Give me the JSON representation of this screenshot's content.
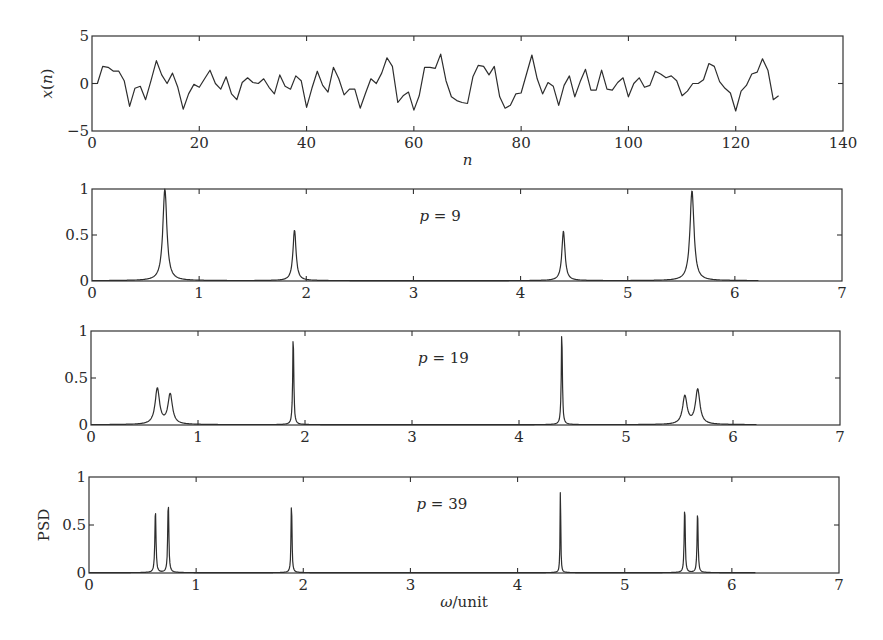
{
  "figure": {
    "colors": {
      "line": "#2e2e2e",
      "frame": "#333333",
      "text": "#2a2a2a",
      "background": "#ffffff"
    }
  },
  "chart_data": [
    {
      "type": "line",
      "panel": "time-series",
      "title": "",
      "xlabel": "n",
      "ylabel": "x(n)",
      "xlim": [
        0,
        140
      ],
      "ylim": [
        -5,
        5
      ],
      "xticks": [
        0,
        20,
        40,
        60,
        80,
        100,
        120,
        140
      ],
      "yticks": [
        -5,
        0,
        5
      ],
      "grid": false,
      "frame_px": {
        "x0": 92,
        "y0": 36,
        "x1": 843,
        "y1": 131
      },
      "x": [
        0,
        1,
        2,
        3,
        4,
        5,
        6,
        7,
        8,
        9,
        10,
        11,
        12,
        13,
        14,
        15,
        16,
        17,
        18,
        19,
        20,
        21,
        22,
        23,
        24,
        25,
        26,
        27,
        28,
        29,
        30,
        31,
        32,
        33,
        34,
        35,
        36,
        37,
        38,
        39,
        40,
        41,
        42,
        43,
        44,
        45,
        46,
        47,
        48,
        49,
        50,
        51,
        52,
        53,
        54,
        55,
        56,
        57,
        58,
        59,
        60,
        61,
        62,
        63,
        64,
        65,
        66,
        67,
        68,
        69,
        70,
        71,
        72,
        73,
        74,
        75,
        76,
        77,
        78,
        79,
        80,
        81,
        82,
        83,
        84,
        85,
        86,
        87,
        88,
        89,
        90,
        91,
        92,
        93,
        94,
        95,
        96,
        97,
        98,
        99,
        100,
        101,
        102,
        103,
        104,
        105,
        106,
        107,
        108,
        109,
        110,
        111,
        112,
        113,
        114,
        115,
        116,
        117,
        118,
        119,
        120,
        121,
        122,
        123,
        124,
        125,
        126,
        127,
        128
      ],
      "values": [
        0,
        0,
        1.8,
        1.7,
        1.3,
        1.3,
        0.3,
        -2.4,
        -0.5,
        -0.3,
        -1.7,
        0.3,
        2.4,
        0.9,
        0,
        1.1,
        -0.4,
        -2.7,
        -1.1,
        -0.1,
        -0.4,
        0.5,
        1.4,
        0,
        -0.6,
        0.7,
        -1.1,
        -1.7,
        0.1,
        0.6,
        0.1,
        0,
        0.5,
        -0.4,
        -1.1,
        0.9,
        -0.3,
        -0.6,
        0.8,
        0.3,
        -2.5,
        -0.5,
        1.3,
        -0.2,
        -0.9,
        1.7,
        0.5,
        -1.2,
        -0.6,
        -0.6,
        -2.6,
        -1,
        0.5,
        0,
        1.1,
        2.7,
        1.8,
        -2,
        -1.3,
        -0.9,
        -2.8,
        -1.3,
        1.7,
        1.7,
        1.6,
        3.1,
        0.3,
        -1.4,
        -1.8,
        -2,
        -2.1,
        0.7,
        1.9,
        1.8,
        0.9,
        1.8,
        -1.4,
        -2.6,
        -2.3,
        -1.1,
        -1,
        1,
        3,
        0.5,
        -1.1,
        0.1,
        -0.3,
        -2.3,
        -0.2,
        0.8,
        -1.4,
        0.2,
        1.5,
        -0.7,
        -0.7,
        1.4,
        -0.6,
        -0.7,
        0.1,
        0.6,
        -1.4,
        0,
        0.6,
        -0.4,
        -0.2,
        1.3,
        1,
        0.6,
        0.8,
        0.3,
        -1.3,
        -0.8,
        0,
        0,
        0.4,
        2.1,
        1.8,
        0.2,
        -0.5,
        -1,
        -2.9,
        -0.8,
        -0.2,
        1,
        1.2,
        2.6,
        1.4,
        -1.7,
        -1.3
      ]
    },
    {
      "type": "line",
      "panel": "psd-p9",
      "annotation": "p = 9",
      "xlabel": "",
      "ylabel": "",
      "xlim": [
        0,
        7
      ],
      "ylim": [
        0,
        1
      ],
      "xticks": [
        0,
        1,
        2,
        3,
        4,
        5,
        6,
        7
      ],
      "yticks": [
        0,
        0.5,
        1
      ],
      "yticklabels": [
        "0",
        "0.5",
        "1"
      ],
      "grid": false,
      "frame_px": {
        "x0": 92,
        "y0": 189,
        "x1": 842,
        "y1": 281
      },
      "omega_max": 6.22,
      "peaks": [
        {
          "omega": 0.68,
          "height": 1.0,
          "width": 0.045
        },
        {
          "omega": 1.89,
          "height": 0.55,
          "width": 0.035
        },
        {
          "omega": 4.4,
          "height": 0.54,
          "width": 0.035
        },
        {
          "omega": 5.6,
          "height": 0.98,
          "width": 0.045
        }
      ]
    },
    {
      "type": "line",
      "panel": "psd-p19",
      "annotation": "p = 19",
      "xlabel": "",
      "ylabel": "",
      "xlim": [
        0,
        7
      ],
      "ylim": [
        0,
        1
      ],
      "xticks": [
        0,
        1,
        2,
        3,
        4,
        5,
        6,
        7
      ],
      "yticks": [
        0,
        0.5,
        1
      ],
      "yticklabels": [
        "0",
        "0.5",
        "1"
      ],
      "grid": false,
      "frame_px": {
        "x0": 91,
        "y0": 331,
        "x1": 840,
        "y1": 425
      },
      "omega_max": 6.22,
      "peaks": [
        {
          "omega": 0.62,
          "height": 0.38,
          "width": 0.05
        },
        {
          "omega": 0.74,
          "height": 0.32,
          "width": 0.05
        },
        {
          "omega": 1.89,
          "height": 0.96,
          "width": 0.012
        },
        {
          "omega": 4.4,
          "height": 1.0,
          "width": 0.012
        },
        {
          "omega": 5.55,
          "height": 0.3,
          "width": 0.05
        },
        {
          "omega": 5.67,
          "height": 0.37,
          "width": 0.05
        }
      ]
    },
    {
      "type": "line",
      "panel": "psd-p39",
      "annotation": "p = 39",
      "xlabel": "ω/unit",
      "ylabel": "PSD",
      "xlim": [
        0,
        7
      ],
      "ylim": [
        0,
        1
      ],
      "xticks": [
        0,
        1,
        2,
        3,
        4,
        5,
        6,
        7
      ],
      "yticks": [
        0,
        0.5,
        1
      ],
      "yticklabels": [
        "0",
        "0.5",
        "1"
      ],
      "grid": false,
      "frame_px": {
        "x0": 89,
        "y0": 477,
        "x1": 839,
        "y1": 573
      },
      "omega_max": 6.22,
      "peaks": [
        {
          "omega": 0.62,
          "height": 0.68,
          "width": 0.012
        },
        {
          "omega": 0.74,
          "height": 0.75,
          "width": 0.012
        },
        {
          "omega": 1.89,
          "height": 0.76,
          "width": 0.01
        },
        {
          "omega": 4.4,
          "height": 1.0,
          "width": 0.007
        },
        {
          "omega": 5.56,
          "height": 0.71,
          "width": 0.011
        },
        {
          "omega": 5.68,
          "height": 0.67,
          "width": 0.011
        }
      ]
    }
  ]
}
